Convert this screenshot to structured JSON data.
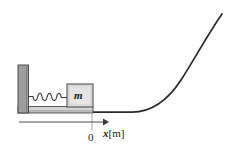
{
  "figure": {
    "kind": "physics-diagram",
    "background_color": "#ffffff",
    "ink_color": "#2b2b2b"
  },
  "labels": {
    "mass": "m",
    "origin": "0",
    "axis_variable": "x",
    "axis_unit": "[m]",
    "axis_full": "x[m]"
  },
  "parts": {
    "wall": {
      "name": "wall",
      "fill": "#9d9d9d",
      "stroke": "#3a3a3a",
      "x": 18,
      "y": 65,
      "width": 10,
      "height": 48
    },
    "floor": {
      "name": "floor",
      "fill": "#b8b8b8",
      "stroke": "#3a3a3a",
      "x": 18,
      "y": 106,
      "width": 75,
      "height": 7
    },
    "block": {
      "name": "mass-block",
      "fill": "#e3e3e3",
      "stroke": "#3a3a3a",
      "x": 67,
      "y": 84,
      "width": 26,
      "height": 23
    },
    "spring": {
      "name": "spring",
      "coils": 4,
      "stroke": "#3a3a3a",
      "x_start": 28,
      "x_end": 67,
      "y": 96
    },
    "ramp": {
      "name": "curved-ramp",
      "stroke": "#2b2b2b",
      "flat_from_x": 93,
      "curve_start_x": 130,
      "top_x": 222,
      "top_y": 14,
      "base_y": 113
    },
    "axis": {
      "name": "x-axis",
      "stroke": "#4a4a4a",
      "x_start": 19,
      "x_end": 107,
      "y": 122,
      "origin_tick_x": 92,
      "tick_top_y": 113,
      "tick_bottom_y": 130
    }
  }
}
